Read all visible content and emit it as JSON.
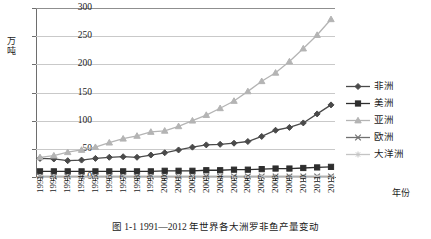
{
  "chart_data": {
    "type": "line",
    "title": "图 1-1  1991—2012 年世界各大洲罗非鱼产量变动",
    "xlabel": "年份",
    "ylabel": "万吨",
    "ylim": [
      0,
      300
    ],
    "yticks": [
      0,
      50,
      100,
      150,
      200,
      250,
      300
    ],
    "grid": true,
    "legend_position": "right",
    "categories": [
      "1991",
      "1992",
      "1993",
      "1994",
      "1995",
      "1996",
      "1997",
      "1998",
      "1999",
      "2000",
      "2001",
      "2002",
      "2003",
      "2004",
      "2005",
      "2006",
      "2007",
      "2008",
      "2009",
      "2010",
      "2011",
      "2012"
    ],
    "series": [
      {
        "name": "非洲",
        "color": "#4a4a4a",
        "marker": "diamond",
        "values": [
          33,
          32,
          29,
          30,
          33,
          35,
          36,
          35,
          39,
          43,
          48,
          53,
          57,
          58,
          60,
          63,
          72,
          83,
          88,
          96,
          112,
          128
        ]
      },
      {
        "name": "美洲",
        "color": "#2e2e2e",
        "marker": "square",
        "values": [
          10,
          10,
          10,
          10,
          10,
          10,
          10,
          10,
          10,
          11,
          11,
          11,
          12,
          12,
          13,
          13,
          14,
          15,
          15,
          16,
          17,
          18
        ]
      },
      {
        "name": "亚洲",
        "color": "#b4b4b4",
        "marker": "triangle",
        "values": [
          35,
          38,
          44,
          48,
          53,
          61,
          68,
          73,
          80,
          82,
          90,
          100,
          110,
          122,
          135,
          152,
          170,
          185,
          205,
          228,
          252,
          280
        ]
      },
      {
        "name": "欧洲",
        "color": "#707070",
        "marker": "cross",
        "values": [
          1,
          1,
          1,
          1,
          1,
          1,
          1,
          1,
          1,
          1,
          1,
          1,
          1,
          1,
          1,
          1,
          1,
          1,
          1,
          1,
          1,
          1
        ]
      },
      {
        "name": "大洋洲",
        "color": "#c4c4c4",
        "marker": "star",
        "values": [
          0,
          0,
          0,
          0,
          0,
          0,
          0,
          0,
          0,
          0,
          0,
          0,
          0,
          0,
          0,
          0,
          0,
          0,
          0,
          0,
          0,
          0
        ]
      }
    ]
  }
}
